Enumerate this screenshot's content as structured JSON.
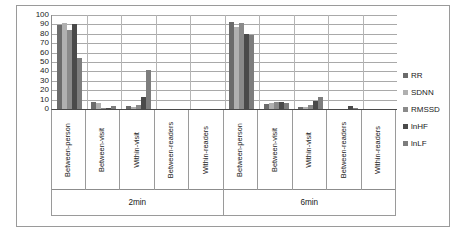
{
  "chart_data": {
    "type": "bar",
    "title": "",
    "subtitle": "",
    "xlabel": "",
    "ylabel": "",
    "ylim": [
      0,
      100
    ],
    "ytick_step": 10,
    "yticks": [
      "100",
      "90",
      "80",
      "70",
      "60",
      "50",
      "40",
      "30",
      "20",
      "10",
      "0"
    ],
    "grid": true,
    "grid_axis": "y",
    "legend_position": "right",
    "orientation": "vertical",
    "group_labels": [
      "2min",
      "6min"
    ],
    "categories": [
      "Between-person",
      "Between-visit",
      "Within-visit",
      "Between-readers",
      "Within-readers"
    ],
    "series": [
      {
        "name": "RR",
        "color": "#6b6b6b",
        "values_2min": [
          89,
          7,
          3,
          0,
          0
        ],
        "values_6min": [
          93,
          5,
          2,
          0,
          0
        ]
      },
      {
        "name": "SDNN",
        "color": "#b0b0b0",
        "values_2min": [
          91,
          6,
          2,
          0,
          0
        ],
        "values_6min": [
          87,
          6,
          2,
          0,
          0
        ]
      },
      {
        "name": "RMSSD",
        "color": "#8a8a8a",
        "values_2min": [
          84,
          1,
          4,
          0,
          0
        ],
        "values_6min": [
          91,
          7,
          4,
          0,
          0
        ]
      },
      {
        "name": "lnHF",
        "color": "#4a4a4a",
        "values_2min": [
          90,
          1,
          13,
          0,
          0
        ],
        "values_6min": [
          80,
          7,
          8,
          3,
          0
        ]
      },
      {
        "name": "lnLF",
        "color": "#7d7d7d",
        "values_2min": [
          54,
          3,
          41,
          0,
          0
        ],
        "values_6min": [
          79,
          6,
          13,
          1,
          0
        ]
      }
    ]
  },
  "legend": {
    "items": [
      {
        "label": "RR"
      },
      {
        "label": "SDNN"
      },
      {
        "label": "RMSSD"
      },
      {
        "label": "lnHF"
      },
      {
        "label": "lnLF"
      }
    ]
  }
}
